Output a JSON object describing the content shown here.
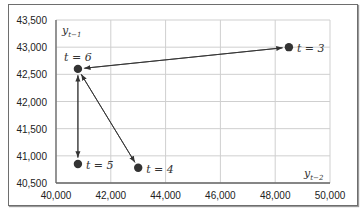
{
  "chart_data": {
    "type": "scatter",
    "title": "",
    "xlabel": "y_{t-2}",
    "ylabel": "y_{t-1}",
    "xlabel_display": {
      "main": "y",
      "sub": "t−2"
    },
    "ylabel_display": {
      "main": "y",
      "sub": "t−1"
    },
    "xlim": [
      40000,
      50000
    ],
    "ylim": [
      40500,
      43500
    ],
    "xticks": [
      40000,
      42000,
      44000,
      46000,
      48000,
      50000
    ],
    "xtick_labels": [
      "40,000",
      "42,000",
      "44,000",
      "46,000",
      "48,000",
      "50,000"
    ],
    "yticks": [
      40500,
      41000,
      41500,
      42000,
      42500,
      43000,
      43500
    ],
    "ytick_labels": [
      "40,500",
      "41,000",
      "41,500",
      "42,000",
      "42,500",
      "43,000",
      "43,500"
    ],
    "grid": true,
    "points": [
      {
        "label": "t = 3",
        "x": 48500,
        "y": 43000,
        "label_pos": "right"
      },
      {
        "label": "t = 4",
        "x": 43000,
        "y": 40780,
        "label_pos": "right"
      },
      {
        "label": "t = 5",
        "x": 40800,
        "y": 40850,
        "label_pos": "right"
      },
      {
        "label": "t = 6",
        "x": 40800,
        "y": 42600,
        "label_pos": "above"
      }
    ],
    "arrows": [
      {
        "from": "t = 3",
        "to": "t = 6"
      },
      {
        "from": "t = 6",
        "to": "t = 3"
      },
      {
        "from": "t = 4",
        "to": "t = 6"
      },
      {
        "from": "t = 6",
        "to": "t = 4"
      },
      {
        "from": "t = 5",
        "to": "t = 6"
      },
      {
        "from": "t = 6",
        "to": "t = 5"
      }
    ],
    "colors": {
      "point": "#333333",
      "arrow": "#333333",
      "grid": "#cfcfcf",
      "axis": "#666666"
    }
  }
}
